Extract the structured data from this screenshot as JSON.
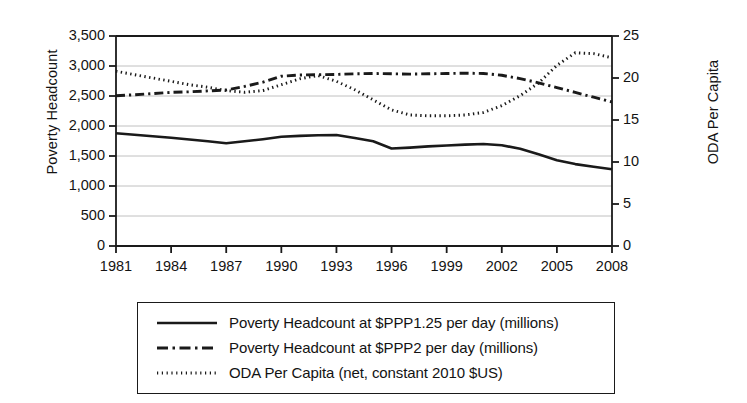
{
  "chart_data": {
    "type": "line",
    "title": "",
    "xlabel": "",
    "ylabel": "Poverty Headcount",
    "ylabel_secondary": "ODA Per Capita",
    "grid": true,
    "legend_position": "below",
    "xlim": [
      1981,
      2008
    ],
    "ylim": [
      0,
      3500
    ],
    "ylim_secondary": [
      0,
      25
    ],
    "xticks": [
      "1981",
      "1984",
      "1987",
      "1990",
      "1993",
      "1996",
      "1999",
      "2002",
      "2005",
      "2008"
    ],
    "yticks_left": [
      "0",
      "500",
      "1,000",
      "1,500",
      "2,000",
      "2,500",
      "3,000",
      "3,500"
    ],
    "yticks_right": [
      "0",
      "5",
      "10",
      "15",
      "20",
      "25"
    ],
    "x": [
      1981,
      1982,
      1983,
      1984,
      1985,
      1986,
      1987,
      1988,
      1989,
      1990,
      1991,
      1992,
      1993,
      1994,
      1995,
      1996,
      1997,
      1998,
      1999,
      2000,
      2001,
      2002,
      2003,
      2004,
      2005,
      2006,
      2007,
      2008
    ],
    "series": [
      {
        "name": "Poverty Headcount at $PPP1.25 per day (millions)",
        "style": "solid",
        "axis": "left",
        "values": [
          1880,
          1855,
          1830,
          1805,
          1775,
          1745,
          1712,
          1745,
          1780,
          1820,
          1835,
          1845,
          1850,
          1800,
          1745,
          1625,
          1640,
          1660,
          1675,
          1690,
          1700,
          1680,
          1620,
          1530,
          1430,
          1365,
          1320,
          1280
        ]
      },
      {
        "name": "Poverty Headcount at $PPP2 per day (millions)",
        "style": "dashdot",
        "axis": "left",
        "values": [
          2505,
          2520,
          2540,
          2560,
          2570,
          2585,
          2600,
          2660,
          2730,
          2830,
          2850,
          2855,
          2860,
          2870,
          2875,
          2870,
          2865,
          2870,
          2875,
          2880,
          2875,
          2845,
          2790,
          2720,
          2640,
          2560,
          2480,
          2400
        ]
      },
      {
        "name": "ODA Per Capita (net, constant 2010 $US)",
        "style": "dotted",
        "axis": "right",
        "values": [
          20.8,
          20.4,
          20.0,
          19.6,
          19.2,
          18.9,
          18.5,
          18.3,
          18.5,
          19.2,
          19.9,
          20.3,
          19.6,
          18.6,
          17.4,
          16.2,
          15.6,
          15.5,
          15.5,
          15.6,
          15.9,
          16.7,
          17.9,
          19.4,
          21.5,
          23.0,
          22.9,
          22.4
        ]
      }
    ]
  },
  "legend": {
    "items": [
      {
        "label": "Poverty Headcount at $PPP1.25 per day (millions)",
        "style": "solid"
      },
      {
        "label": "Poverty Headcount at $PPP2 per day (millions)",
        "style": "dashdot"
      },
      {
        "label": "ODA Per Capita (net, constant 2010 $US)",
        "style": "dotted"
      }
    ]
  },
  "colors": {
    "line": "#1a1a1a",
    "grid": "#b9b9b9",
    "axis": "#1a1a1a",
    "background": "#ffffff"
  }
}
